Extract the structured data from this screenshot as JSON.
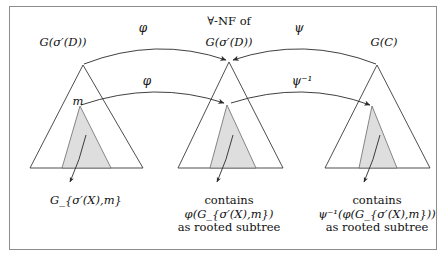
{
  "figure": {
    "kind": "commutative-diagram-of-rooted-trees",
    "background_color": "#ffffff",
    "frame_color": "#8d8d8d",
    "line_color": "#333333",
    "shade_fill": "#dedede",
    "shade_stroke": "#6a6a6a",
    "text_color": "#111111"
  },
  "top_labels": {
    "left_tree": {
      "cal": "G",
      "open": "(",
      "sigma": "σ",
      "prime": "′",
      "arg": "(D)",
      "close": ")",
      "full": "G(σ′(D))"
    },
    "center_caption": "∀-NF of",
    "center_tree": {
      "full": "G(σ′(D))"
    },
    "right_tree": {
      "full": "G(C)"
    }
  },
  "arrow_labels": {
    "upper_left": "φ",
    "upper_right": "ψ",
    "lower_left": "φ",
    "lower_right_base": "ψ",
    "lower_right_exp": "−1",
    "lower_right_full": "ψ⁻¹"
  },
  "node_labels": {
    "subtree_root_marker": "m"
  },
  "bottom_labels": {
    "left": {
      "line1": "G",
      "subscript": "σ′(X),m",
      "full": "G_{σ′(X),m}"
    },
    "center": {
      "line1": "contains",
      "line2_full": "φ(G_{σ′(X),m})",
      "line3": "as rooted subtree"
    },
    "right": {
      "line1": "contains",
      "line2_full": "ψ⁻¹(φ(G_{σ′(X),m}))",
      "line3": "as rooted subtree"
    }
  },
  "trees": [
    {
      "name": "left-tree",
      "apex_x": 83,
      "apex_y": 65,
      "base_y": 168,
      "base_left_x": 30,
      "base_right_x": 143
    },
    {
      "name": "center-tree",
      "apex_x": 229,
      "apex_y": 62,
      "base_y": 168,
      "base_left_x": 178,
      "base_right_x": 283
    },
    {
      "name": "right-tree",
      "apex_x": 377,
      "apex_y": 65,
      "base_y": 168,
      "base_left_x": 325,
      "base_right_x": 430
    }
  ],
  "subtrees": [
    {
      "name": "left-subtree",
      "apex_x": 80,
      "apex_y": 106,
      "base_y": 168,
      "base_left_x": 62,
      "base_right_x": 111
    },
    {
      "name": "center-subtree",
      "apex_x": 227,
      "apex_y": 105,
      "base_y": 168,
      "base_left_x": 210,
      "base_right_x": 256
    },
    {
      "name": "right-subtree",
      "apex_x": 372,
      "apex_y": 106,
      "base_y": 168,
      "base_left_x": 359,
      "base_right_x": 397
    }
  ]
}
